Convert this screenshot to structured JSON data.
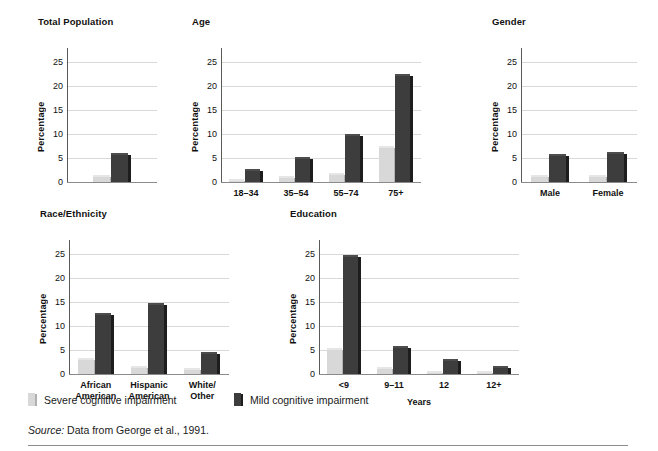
{
  "figure": {
    "legend": [
      {
        "key": "severe",
        "label": "Severe cognitive impairment",
        "color": "#d8d8d8"
      },
      {
        "key": "mild",
        "label": "Mild cognitive impairment",
        "color": "#3d3d3d"
      }
    ],
    "source_prefix": "Source:",
    "source_text": " Data from George et al., 1991."
  },
  "chart_data": [
    {
      "type": "bar",
      "title": "Total Population",
      "xlabel": "",
      "ylabel": "Percentage",
      "ylim": [
        0,
        27
      ],
      "yticks": [
        0,
        5,
        10,
        15,
        20,
        25
      ],
      "grid": true,
      "legend_position": "below-figure",
      "categories": [
        ""
      ],
      "series": [
        {
          "name": "Severe cognitive impairment",
          "values": [
            1.0
          ]
        },
        {
          "name": "Mild cognitive impairment",
          "values": [
            5.6
          ]
        }
      ]
    },
    {
      "type": "bar",
      "title": "Age",
      "xlabel": "",
      "ylabel": "Percentage",
      "ylim": [
        0,
        27
      ],
      "yticks": [
        0,
        5,
        10,
        15,
        20,
        25
      ],
      "grid": true,
      "legend_position": "below-figure",
      "categories": [
        "18–34",
        "35–54",
        "55–74",
        "75+"
      ],
      "series": [
        {
          "name": "Severe cognitive impairment",
          "values": [
            0.2,
            0.8,
            1.5,
            7.1
          ]
        },
        {
          "name": "Mild cognitive impairment",
          "values": [
            2.3,
            4.8,
            9.6,
            22.0
          ]
        }
      ]
    },
    {
      "type": "bar",
      "title": "Gender",
      "xlabel": "",
      "ylabel": "Percentage",
      "ylim": [
        0,
        27
      ],
      "yticks": [
        0,
        5,
        10,
        15,
        20,
        25
      ],
      "grid": true,
      "legend_position": "below-figure",
      "categories": [
        "Male",
        "Female"
      ],
      "series": [
        {
          "name": "Severe cognitive impairment",
          "values": [
            1.0,
            1.0
          ]
        },
        {
          "name": "Mild cognitive impairment",
          "values": [
            5.5,
            5.8
          ]
        }
      ]
    },
    {
      "type": "bar",
      "title": "Race/Ethnicity",
      "xlabel": "",
      "ylabel": "Percentage",
      "ylim": [
        0,
        27
      ],
      "yticks": [
        0,
        5,
        10,
        15,
        20,
        25
      ],
      "grid": true,
      "legend_position": "below-figure",
      "categories": [
        "African\nAmerican",
        "Hispanic\nAmerican",
        "White/\nOther"
      ],
      "series": [
        {
          "name": "Severe cognitive impairment",
          "values": [
            3.0,
            1.2,
            0.9
          ]
        },
        {
          "name": "Mild cognitive impairment",
          "values": [
            12.2,
            14.3,
            4.2
          ]
        }
      ]
    },
    {
      "type": "bar",
      "title": "Education",
      "xlabel": "Years",
      "ylabel": "Percentage",
      "ylim": [
        0,
        27
      ],
      "yticks": [
        0,
        5,
        10,
        15,
        20,
        25
      ],
      "grid": true,
      "legend_position": "below-figure",
      "categories": [
        "<9",
        "9–11",
        "12",
        "12+"
      ],
      "series": [
        {
          "name": "Severe cognitive impairment",
          "values": [
            5.0,
            1.0,
            0.1,
            0.1
          ]
        },
        {
          "name": "Mild cognitive impairment",
          "values": [
            24.2,
            5.5,
            2.8,
            1.2
          ]
        }
      ]
    }
  ]
}
